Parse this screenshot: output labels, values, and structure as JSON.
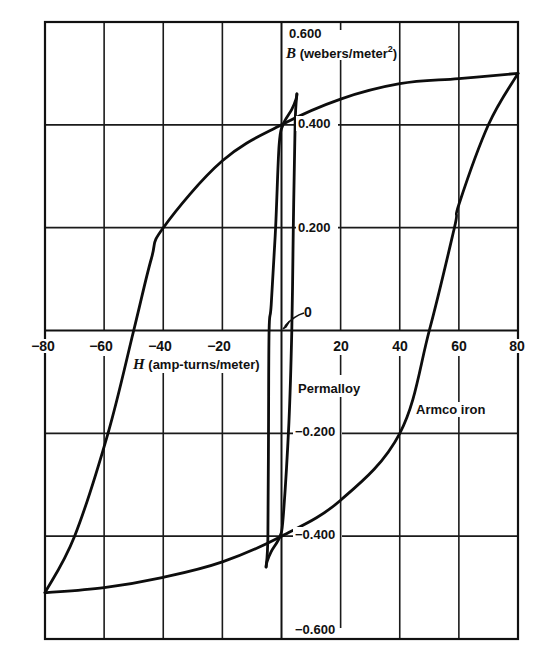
{
  "chart_data": {
    "type": "line",
    "title": "",
    "xlabel": "H (amp-turns/meter)",
    "ylabel": "B (webers/meter²)",
    "xlim": [
      -80,
      80
    ],
    "ylim": [
      -0.6,
      0.6
    ],
    "grid": true,
    "x_ticks": [
      -80,
      -60,
      -40,
      -20,
      0,
      20,
      40,
      60,
      80
    ],
    "x_tick_labels": [
      "−80",
      "−60",
      "−40",
      "−20",
      "20",
      "40",
      "60",
      "80"
    ],
    "y_ticks": [
      -0.6,
      -0.4,
      -0.2,
      0,
      0.2,
      0.4,
      0.6
    ],
    "y_tick_labels": [
      "0.600",
      "0.400",
      "0.200",
      "−0.200",
      "−0.400",
      "−0.600"
    ],
    "origin_label": "0",
    "legend_position": "inline labels",
    "series": [
      {
        "name": "Armco iron",
        "description": "Hysteresis loop; Bmax ≈ 0.50 at H = ±80, remanence Br ≈ 0.40, coercive force Hc ≈ 50",
        "branches": [
          {
            "name": "descending",
            "H": [
              80,
              60,
              40,
              20,
              0,
              -20,
              -40,
              -44,
              -50,
              -58.7,
              -70,
              -80
            ],
            "B": [
              0.5,
              0.49,
              0.48,
              0.45,
              0.4,
              0.33,
              0.2,
              0.14,
              0.0,
              -0.2,
              -0.4,
              -0.51
            ]
          },
          {
            "name": "ascending",
            "H": [
              -80,
              -60,
              -40,
              -20,
              0,
              20,
              40,
              50,
              58.5,
              60,
              70,
              80
            ],
            "B": [
              -0.51,
              -0.5,
              -0.48,
              -0.45,
              -0.4,
              -0.33,
              -0.2,
              0.0,
              0.2,
              0.245,
              0.4,
              0.5
            ]
          }
        ]
      },
      {
        "name": "Permalloy",
        "description": "Narrow hysteresis loop; Bmax ≈ 0.46 at H ≈ ±5, remanence ≈ 0.40, coercive force ≈ 4",
        "branches": [
          {
            "name": "descending",
            "H": [
              5.2,
              4.9,
              3.5,
              0.5,
              -0.8,
              -2.0,
              -3.5,
              -4.2,
              -4.4,
              -4.6,
              -5.2
            ],
            "B": [
              0.46,
              0.45,
              0.43,
              0.4,
              0.36,
              0.2,
              0.05,
              0.0,
              -0.2,
              -0.4,
              -0.46
            ]
          },
          {
            "name": "ascending",
            "H": [
              -5.2,
              -4.9,
              -3.5,
              -0.5,
              0.6,
              2.5,
              3.5,
              4.0,
              4.6,
              5.2
            ],
            "B": [
              -0.46,
              -0.45,
              -0.43,
              -0.4,
              -0.36,
              -0.18,
              0.0,
              0.2,
              0.4,
              0.46
            ]
          }
        ]
      }
    ]
  },
  "labels": {
    "y_axis_title_var": "B",
    "y_axis_title_unit": "(webers/meter",
    "y_axis_title_sup": "2",
    "y_axis_title_close": ")",
    "x_axis_title_var": "H",
    "x_axis_title_unit": "(amp-turns/meter)",
    "origin": "0",
    "series_permalloy": "Permalloy",
    "series_armco": "Armco iron",
    "x_ticks": {
      "m80": "−80",
      "m60": "−60",
      "m40": "−40",
      "m20": "−20",
      "p20": "20",
      "p40": "40",
      "p60": "60",
      "p80": "80"
    },
    "y_ticks": {
      "p600": "0.600",
      "p400": "0.400",
      "p200": "0.200",
      "m200": "−0.200",
      "m400": "−0.400",
      "m600": "−0.600"
    }
  }
}
